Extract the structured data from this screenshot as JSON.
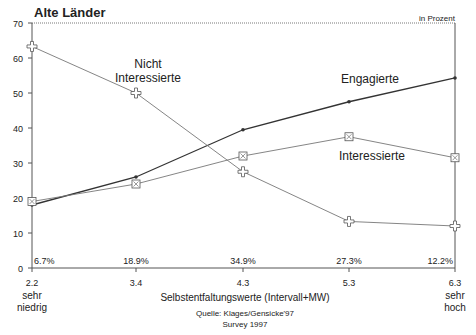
{
  "chart_data": {
    "type": "line",
    "title": "Alte Länder",
    "unit_label": "in Prozent",
    "xlabel": "Selbstentfaltungswerte (Intervall+MW)",
    "ylabel": "",
    "ylim": [
      0,
      70
    ],
    "yticks": [
      0,
      10,
      20,
      30,
      40,
      50,
      60,
      70
    ],
    "x": [
      2.2,
      3.4,
      4.3,
      5.3,
      6.3
    ],
    "xtick_labels": [
      "2.2",
      "3.4",
      "4.3",
      "5.3",
      "6.3"
    ],
    "x_end_labels": {
      "low": [
        "sehr",
        "niedrig"
      ],
      "high": [
        "sehr",
        "hoch"
      ]
    },
    "group_shares": [
      "6.7%",
      "18.9%",
      "34.9%",
      "27.3%",
      "12.2%"
    ],
    "series": [
      {
        "name": "Engagierte",
        "label_lines": [
          "Engagierte"
        ],
        "marker": "dot",
        "values": [
          18,
          26,
          39.5,
          47.5,
          54.3
        ]
      },
      {
        "name": "Interessierte",
        "label_lines": [
          "Interessierte"
        ],
        "marker": "square",
        "values": [
          19,
          24,
          32,
          37.5,
          31.5
        ]
      },
      {
        "name": "Nicht Interessierte",
        "label_lines": [
          "Nicht",
          "Interessierte"
        ],
        "marker": "cross",
        "values": [
          63.3,
          50,
          27.5,
          13.3,
          12
        ]
      }
    ],
    "source": [
      "Quelle: Klages/Gensicke'97",
      "Survey 1997"
    ],
    "grid": false,
    "colors": {
      "axis": "#555555",
      "engagierte": "#333333",
      "other_lines": "#777777"
    }
  }
}
